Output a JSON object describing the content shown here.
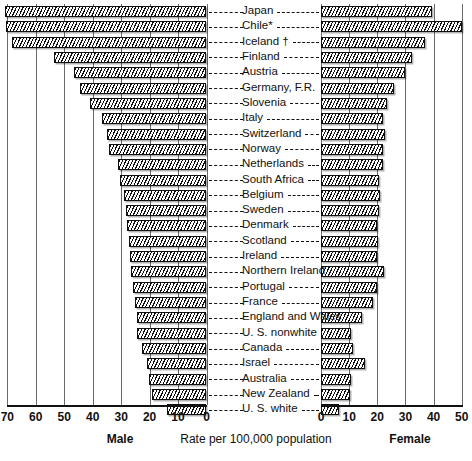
{
  "chart_data": {
    "type": "bar",
    "subtype": "population-pyramid-diverging-bar",
    "title": "",
    "xlabel": "Rate per 100,000 population",
    "ylabel": "",
    "grid": true,
    "legend_position": "none",
    "left_panel": {
      "label": "Male",
      "axis_ticks": [
        70,
        60,
        50,
        40,
        30,
        20,
        10,
        0
      ],
      "xlim": [
        70,
        0
      ],
      "direction": "right-to-left"
    },
    "right_panel": {
      "label": "Female",
      "axis_ticks": [
        0,
        10,
        20,
        30,
        40,
        50
      ],
      "xlim": [
        0,
        50
      ],
      "direction": "left-to-right"
    },
    "categories": [
      "Japan",
      "Chile*",
      "Iceland †",
      "Finland",
      "Austria",
      "Germany, F.R.",
      "Slovenia",
      "Italy",
      "Switzerland",
      "Norway",
      "Netherlands",
      "South Africa",
      "Belgium",
      "Sweden",
      "Denmark",
      "Scotland",
      "Ireland",
      "Northern Ireland",
      "Portugal",
      "France",
      "England and Wales",
      "U. S. nonwhite",
      "Canada",
      "Israel",
      "Australia",
      "New Zealand",
      "U. S. white"
    ],
    "series": [
      {
        "name": "Male",
        "values": [
          71.0,
          70.6,
          68.3,
          53.7,
          46.4,
          44.3,
          41.0,
          36.6,
          35.0,
          34.4,
          31.0,
          30.4,
          29.0,
          28.2,
          27.8,
          27.4,
          27.0,
          26.6,
          25.8,
          25.3,
          24.5,
          24.3,
          22.5,
          21.0,
          20.2,
          19.0,
          14.0
        ]
      },
      {
        "name": "Female",
        "values": [
          39.5,
          50.0,
          37.0,
          32.3,
          30.0,
          26.0,
          23.5,
          22.0,
          22.7,
          22.0,
          22.2,
          20.5,
          20.8,
          20.5,
          20.0,
          20.3,
          20.0,
          22.5,
          20.0,
          18.5,
          14.5,
          10.5,
          11.5,
          15.5,
          10.5,
          10.3,
          6.5
        ]
      }
    ],
    "footnotes": [
      "*",
      "†"
    ]
  },
  "axis": {
    "male_title": "Male",
    "female_title": "Female",
    "center_caption": "Rate per 100,000 population",
    "male_ticks": [
      "70",
      "60",
      "50",
      "40",
      "30",
      "20",
      "10",
      "0"
    ],
    "female_ticks": [
      "0",
      "10",
      "20",
      "30",
      "40",
      "50"
    ]
  },
  "colors": {
    "ink": "#111111",
    "grid": "#6a6a6a",
    "paper": "#ffffff",
    "hatch": "#111111"
  }
}
